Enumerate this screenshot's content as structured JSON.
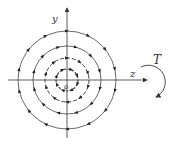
{
  "diagram": {
    "labels": {
      "y_axis": "y",
      "z_axis": "z",
      "origin": "o",
      "torque": "T"
    },
    "center": [
      67,
      80
    ],
    "radii": [
      11,
      22,
      34,
      49
    ],
    "direction": "clockwise",
    "colors": {
      "stroke": "#333333",
      "background": "#ffffff"
    }
  }
}
